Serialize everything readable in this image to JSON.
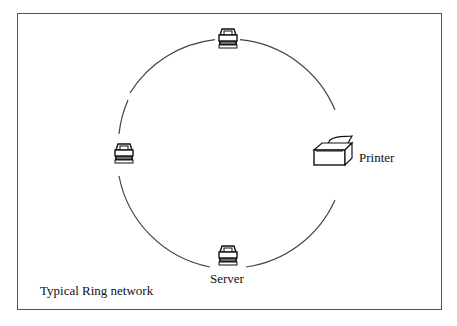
{
  "diagram": {
    "caption": "Typical Ring network",
    "ring": {
      "cx": 228,
      "cy": 154,
      "r": 115,
      "stroke": "#444444"
    },
    "nodes": [
      {
        "id": "top",
        "type": "workstation",
        "label": "",
        "x": 228,
        "y": 38
      },
      {
        "id": "left",
        "type": "workstation",
        "label": "",
        "x": 125,
        "y": 154
      },
      {
        "id": "right",
        "type": "printer",
        "label": "Printer",
        "x": 340,
        "y": 158
      },
      {
        "id": "bottom",
        "type": "workstation",
        "label": "Server",
        "x": 228,
        "y": 258
      }
    ]
  }
}
